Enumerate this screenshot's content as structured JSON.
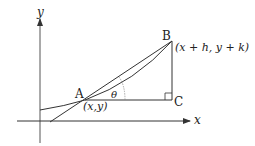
{
  "diagram": {
    "axes": {
      "x_label": "x",
      "y_label": "y"
    },
    "points": {
      "A": {
        "label": "A",
        "coord_label": "(x,y)"
      },
      "B": {
        "label": "B",
        "coord_label": "(x + h, y + k)"
      },
      "C": {
        "label": "C"
      }
    },
    "angle_label": "θ",
    "colors": {
      "stroke": "#333333",
      "text": "#222222"
    }
  }
}
